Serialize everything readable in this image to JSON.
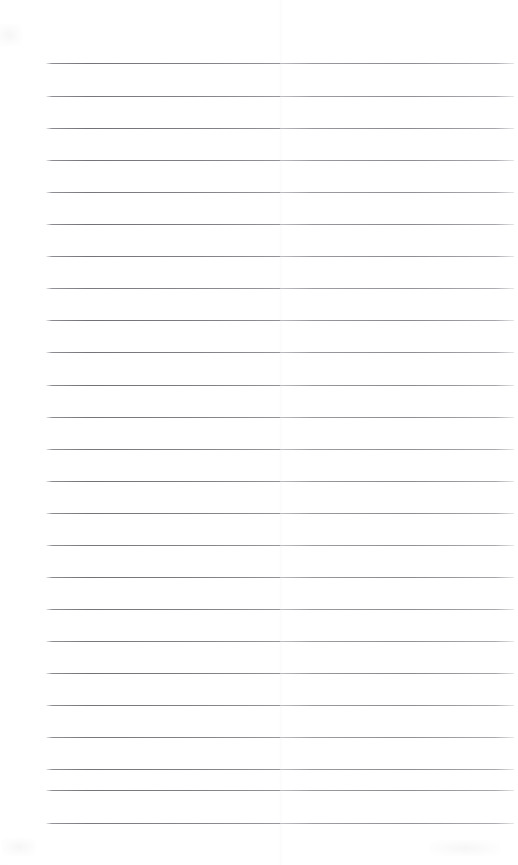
{
  "document": {
    "kind": "scanned-lined-page",
    "title": "Blank Lined Notebook Page",
    "description": "Scanned blank ruled sheet with horizontal lines and no written content",
    "page_width": 518,
    "page_height": 865,
    "background_color": "#ffffff",
    "rule_color": "#5a5c62",
    "rule_color_light": "#86888e",
    "seam_color": "#e9e9ec",
    "visible_text": []
  },
  "ruling": {
    "line_count": 24,
    "first_line_y": 63,
    "line_spacing": 33,
    "line_start_x": 46,
    "line_end_x": 514,
    "line_thickness": 1,
    "seam_x": 280,
    "lines": [
      {
        "index": 1,
        "y": 63,
        "x_start": 46,
        "x_end": 514,
        "opacity": 0.9
      },
      {
        "index": 2,
        "y": 96,
        "x_start": 46,
        "x_end": 514,
        "opacity": 0.88
      },
      {
        "index": 3,
        "y": 128,
        "x_start": 46,
        "x_end": 514,
        "opacity": 0.92
      },
      {
        "index": 4,
        "y": 160,
        "x_start": 46,
        "x_end": 514,
        "opacity": 0.9
      },
      {
        "index": 5,
        "y": 192,
        "x_start": 46,
        "x_end": 514,
        "opacity": 0.88
      },
      {
        "index": 6,
        "y": 224,
        "x_start": 46,
        "x_end": 514,
        "opacity": 0.92
      },
      {
        "index": 7,
        "y": 256,
        "x_start": 46,
        "x_end": 514,
        "opacity": 0.9
      },
      {
        "index": 8,
        "y": 288,
        "x_start": 46,
        "x_end": 514,
        "opacity": 0.86
      },
      {
        "index": 9,
        "y": 320,
        "x_start": 46,
        "x_end": 514,
        "opacity": 0.92
      },
      {
        "index": 10,
        "y": 352,
        "x_start": 46,
        "x_end": 514,
        "opacity": 0.9
      },
      {
        "index": 11,
        "y": 385,
        "x_start": 46,
        "x_end": 514,
        "opacity": 0.92
      },
      {
        "index": 12,
        "y": 417,
        "x_start": 46,
        "x_end": 514,
        "opacity": 0.9
      },
      {
        "index": 13,
        "y": 449,
        "x_start": 46,
        "x_end": 514,
        "opacity": 0.88
      },
      {
        "index": 14,
        "y": 481,
        "x_start": 46,
        "x_end": 514,
        "opacity": 0.92
      },
      {
        "index": 15,
        "y": 513,
        "x_start": 46,
        "x_end": 514,
        "opacity": 0.9
      },
      {
        "index": 16,
        "y": 545,
        "x_start": 46,
        "x_end": 514,
        "opacity": 0.88
      },
      {
        "index": 17,
        "y": 577,
        "x_start": 46,
        "x_end": 514,
        "opacity": 0.92
      },
      {
        "index": 18,
        "y": 609,
        "x_start": 46,
        "x_end": 514,
        "opacity": 0.9
      },
      {
        "index": 19,
        "y": 641,
        "x_start": 46,
        "x_end": 514,
        "opacity": 0.88
      },
      {
        "index": 20,
        "y": 673,
        "x_start": 46,
        "x_end": 514,
        "opacity": 0.92
      },
      {
        "index": 21,
        "y": 705,
        "x_start": 46,
        "x_end": 514,
        "opacity": 0.9
      },
      {
        "index": 22,
        "y": 737,
        "x_start": 46,
        "x_end": 514,
        "opacity": 0.88
      },
      {
        "index": 23,
        "y": 790,
        "x_start": 46,
        "x_end": 514,
        "opacity": 0.9
      },
      {
        "index": 24,
        "y": 823,
        "x_start": 46,
        "x_end": 514,
        "opacity": 0.86
      }
    ],
    "extra_lines": [
      {
        "index": 23,
        "y": 769,
        "x_start": 46,
        "x_end": 514,
        "opacity": 0.9
      }
    ]
  },
  "margins": {
    "top_margin_height": 63,
    "bottom_margin_height": 42,
    "left_margin_width": 46,
    "right_margin_width": 4
  }
}
